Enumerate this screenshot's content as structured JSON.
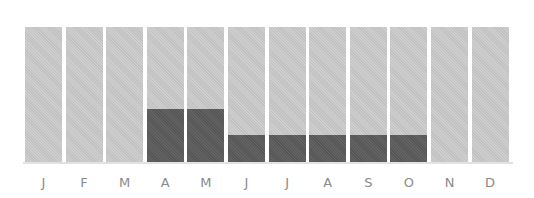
{
  "chart_data": {
    "type": "bar",
    "title": "",
    "xlabel": "",
    "ylabel": "",
    "categories": [
      "J",
      "F",
      "M",
      "A",
      "M",
      "J",
      "J",
      "A",
      "S",
      "O",
      "N",
      "D"
    ],
    "series": [
      {
        "name": "filled",
        "values": [
          0,
          0,
          0,
          39,
          39,
          20,
          20,
          20,
          20,
          20,
          0,
          0
        ],
        "color": "#5b5b5b"
      },
      {
        "name": "total",
        "values": [
          100,
          100,
          100,
          100,
          100,
          100,
          100,
          100,
          100,
          100,
          100,
          100
        ],
        "color": "#c9c9c9"
      }
    ],
    "ylim": [
      0,
      100
    ],
    "grid": false,
    "legend": "none",
    "stacked_overlay": true
  },
  "colors": {
    "track": "#c9c9c9",
    "fill": "#5b5b5b",
    "label": "#8a8a8a"
  }
}
